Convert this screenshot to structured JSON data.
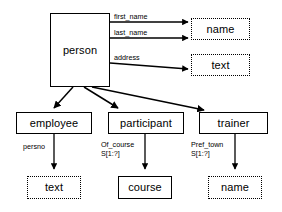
{
  "diagram": {
    "background_color": "#ffffff",
    "line_color": "#000000",
    "nodes": {
      "person": {
        "label": "person",
        "style": "solid"
      },
      "name_top": {
        "label": "name",
        "style": "dotted"
      },
      "text_top": {
        "label": "text",
        "style": "dotted"
      },
      "employee": {
        "label": "employee",
        "style": "solid"
      },
      "participant": {
        "label": "participant",
        "style": "solid"
      },
      "trainer": {
        "label": "trainer",
        "style": "solid"
      },
      "text_bottom": {
        "label": "text",
        "style": "dotted"
      },
      "course": {
        "label": "course",
        "style": "solid"
      },
      "name_bottom": {
        "label": "name",
        "style": "dotted"
      }
    },
    "edge_labels": {
      "first_name": "first_name",
      "last_name": "last_name",
      "address": "address",
      "persno": "persno",
      "of_course": "Of_course",
      "of_course_card": "S[1:?]",
      "pref_town": "Pref_town",
      "pref_town_card": "S[1:?]"
    }
  }
}
